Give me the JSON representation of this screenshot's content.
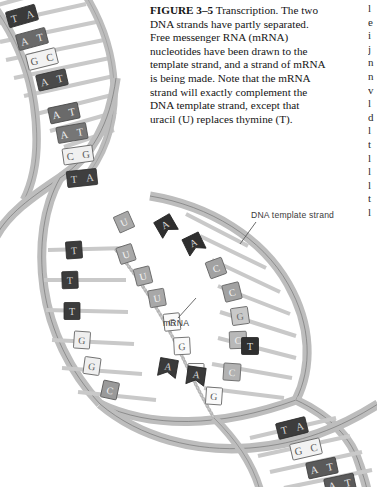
{
  "figure": {
    "number_label": "FIGURE 3–5",
    "title": "Transcription.",
    "caption_body": "The two DNA strands have partly separated. Free messenger RNA (mRNA) nucleotides have been drawn to the template strand, and a strand of mRNA is being made. Note that the mRNA strand will exactly complement the DNA template strand, except that uracil (U) replaces thymine (T).",
    "column_sliver_text": "l\ne\ni\nj\nn\nn\nv\nl\nd\nl\nt\nl\nl\nl\nt\nl"
  },
  "labels": {
    "dna_template_strand": "DNA  template strand",
    "mrna": "mRNA"
  },
  "colors": {
    "backbone_fill": "#bdbdbd",
    "backbone_stroke": "#6e6e6e",
    "rung": "#c9c9c9",
    "base_dark": "#3a3a3a",
    "base_mid": "#8f8f8f",
    "base_light": "#f2f2f2",
    "base_stroke": "#5a5a5a",
    "text": "#141414",
    "label_text": "#3a3a3a",
    "mrna_strand": "#b5b5b5",
    "background": "#ffffff"
  },
  "diagram": {
    "type": "dna-transcription-schematic",
    "top_helix_base_pairs": [
      {
        "left": "T",
        "right": "A",
        "shade": "dark"
      },
      {
        "left": "A",
        "right": "T",
        "shade": "dark"
      },
      {
        "left": "G",
        "right": "C",
        "shade": "light"
      },
      {
        "left": "A",
        "right": "T",
        "shade": "dark"
      },
      {
        "left": "A",
        "right": "T",
        "shade": "dark"
      },
      {
        "left": "A",
        "right": "T",
        "shade": "dark"
      },
      {
        "left": "C",
        "right": "G",
        "shade": "light"
      },
      {
        "left": "T",
        "right": "A",
        "shade": "dark"
      }
    ],
    "bubble_template_bases": [
      "A",
      "A",
      "A",
      "C",
      "C",
      "C",
      "A",
      "A",
      "C"
    ],
    "bubble_mrna_nucleotides": [
      "U",
      "U",
      "U",
      "G",
      "G",
      "G",
      "U",
      "U",
      "G"
    ],
    "bubble_left_strand_bases": [
      "T",
      "T",
      "T",
      "G",
      "G",
      "C"
    ],
    "bottom_helix_base_pairs": [
      {
        "left": "T",
        "right": "A",
        "shade": "dark"
      },
      {
        "left": "G",
        "right": "C",
        "shade": "light"
      },
      {
        "left": "A",
        "right": "T",
        "shade": "dark"
      },
      {
        "left": "A",
        "right": "T",
        "shade": "dark"
      }
    ]
  }
}
